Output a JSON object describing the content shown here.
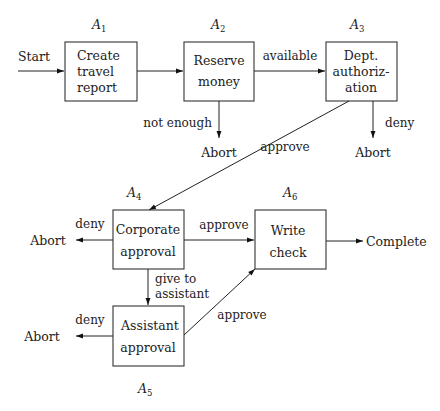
{
  "diagram": {
    "type": "flowchart",
    "start_label": "Start",
    "nodes": [
      {
        "id": "A1",
        "letter": "A",
        "sub": "1",
        "lines": [
          "Create",
          "travel",
          "report"
        ]
      },
      {
        "id": "A2",
        "letter": "A",
        "sub": "2",
        "lines": [
          "Reserve",
          "money"
        ]
      },
      {
        "id": "A3",
        "letter": "A",
        "sub": "3",
        "lines": [
          "Dept.",
          "authoriz-",
          "ation"
        ]
      },
      {
        "id": "A4",
        "letter": "A",
        "sub": "4",
        "lines": [
          "Corporate",
          "approval"
        ]
      },
      {
        "id": "A5",
        "letter": "A",
        "sub": "5",
        "lines": [
          "Assistant",
          "approval"
        ]
      },
      {
        "id": "A6",
        "letter": "A",
        "sub": "6",
        "lines": [
          "Write",
          "check"
        ]
      }
    ],
    "terminals": {
      "abort": "Abort",
      "complete": "Complete"
    },
    "edges": [
      {
        "from": "Start",
        "to": "A1",
        "label": ""
      },
      {
        "from": "A1",
        "to": "A2",
        "label": ""
      },
      {
        "from": "A2",
        "to": "A3",
        "label": "available"
      },
      {
        "from": "A2",
        "to": "Abort",
        "label": "not enough"
      },
      {
        "from": "A3",
        "to": "Abort",
        "label": "deny"
      },
      {
        "from": "A3",
        "to": "A4",
        "label": "approve"
      },
      {
        "from": "A4",
        "to": "Abort",
        "label": "deny"
      },
      {
        "from": "A4",
        "to": "A6",
        "label": "approve"
      },
      {
        "from": "A4",
        "to": "A5",
        "label_lines": [
          "give to",
          "assistant"
        ]
      },
      {
        "from": "A5",
        "to": "Abort",
        "label": "deny"
      },
      {
        "from": "A5",
        "to": "A6",
        "label": "approve"
      },
      {
        "from": "A6",
        "to": "Complete",
        "label": ""
      }
    ]
  }
}
